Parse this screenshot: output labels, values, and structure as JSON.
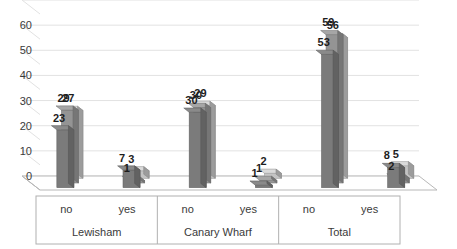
{
  "chart_data": {
    "type": "bar",
    "title": "",
    "subtitle": "",
    "xlabel": "",
    "ylabel": "",
    "ylim": [
      0,
      70
    ],
    "yticks": [
      0,
      10,
      20,
      30,
      40,
      50,
      60
    ],
    "ytick_labels": [
      "0",
      "10",
      "20",
      "30",
      "40",
      "50",
      "60"
    ],
    "grid": true,
    "grid_orientation": "horizontal",
    "legend": false,
    "legend_position": "none",
    "projection": "3d-column",
    "categories": [
      "no",
      "yes",
      "no",
      "yes",
      "no",
      "yes"
    ],
    "groups": [
      {
        "name": "Lewisham",
        "categories": [
          "no",
          "yes"
        ]
      },
      {
        "name": "Canary Wharf",
        "categories": [
          "no",
          "yes"
        ]
      },
      {
        "name": "Total",
        "categories": [
          "no",
          "yes"
        ]
      }
    ],
    "series": [
      {
        "name": "series-1",
        "color": "#7b7b7b",
        "values": [
          23,
          7,
          30,
          1,
          53,
          8
        ]
      },
      {
        "name": "series-2",
        "color": "#949494",
        "values": [
          29,
          1,
          30,
          1,
          59,
          2
        ]
      },
      {
        "name": "series-3",
        "color": "#c3c3c3",
        "values": [
          27,
          3,
          29,
          2,
          56,
          5
        ]
      }
    ],
    "data_labels": [
      "23",
      "29",
      "27",
      "7",
      "1",
      "3",
      "30",
      "30",
      "29",
      "1",
      "1",
      "2",
      "53",
      "59",
      "56",
      "8",
      "2",
      "5"
    ],
    "colors": {
      "series_1": "#7b7b7b",
      "series_2": "#949494",
      "series_3": "#c3c3c3",
      "gridline": "#e2e2e2",
      "axis": "#b8b8b8",
      "text": "#3a3a3a",
      "label": "#1d1d1d",
      "background": "#ffffff"
    }
  }
}
